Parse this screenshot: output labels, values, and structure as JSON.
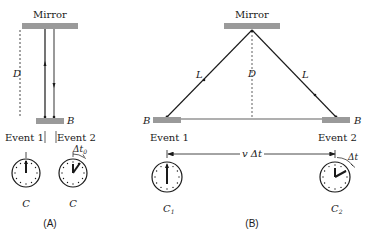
{
  "colors": {
    "ink": "#1a1a1a",
    "mirror_fill": "#9a9a9a",
    "background": "#ffffff"
  },
  "panel_a": {
    "caption": "(A)",
    "mirror_label": "Mirror",
    "distance_label": "D",
    "bottom_mirror_label": "B",
    "event1_label": "Event 1",
    "event2_label": "Event 2",
    "delta_label": "Δt",
    "delta_subscript": "0",
    "clock1_label": "C",
    "clock2_label": "C"
  },
  "panel_b": {
    "caption": "(B)",
    "mirror_label": "Mirror",
    "left_leg_label": "L",
    "right_leg_label": "L",
    "distance_label": "D",
    "left_mirror_label": "B",
    "right_mirror_label": "B",
    "event1_label": "Event 1",
    "event2_label": "Event 2",
    "displacement_label": "v Δt",
    "delta_label": "Δt",
    "clock1_label": "C",
    "clock1_subscript": "1",
    "clock2_label": "C",
    "clock2_subscript": "2"
  }
}
